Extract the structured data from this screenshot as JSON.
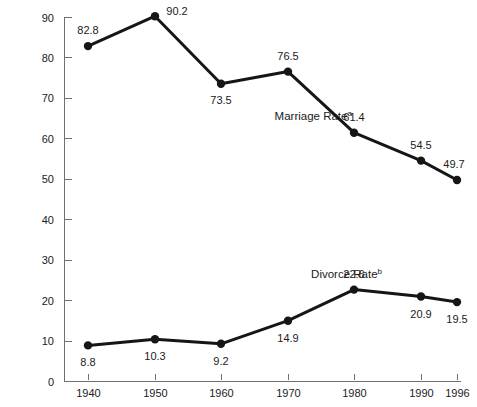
{
  "chart_data": {
    "type": "line",
    "title": "",
    "xlabel": "",
    "ylabel": "",
    "categories": [
      "1940",
      "1950",
      "1960",
      "1970",
      "1980",
      "1990",
      "1996"
    ],
    "x": [
      1940,
      1950,
      1960,
      1970,
      1980,
      1990,
      1996
    ],
    "xlim": [
      1940,
      1996
    ],
    "ylim": [
      0,
      90
    ],
    "y_ticks": [
      "0",
      "10",
      "20",
      "30",
      "40",
      "50",
      "60",
      "70",
      "80",
      "90"
    ],
    "y_tick_values": [
      0,
      10,
      20,
      30,
      40,
      50,
      60,
      70,
      80,
      90
    ],
    "grid": false,
    "legend_position": "inline-annotation",
    "series": [
      {
        "name": "Marriage Rate",
        "footnote": "a",
        "label_x": 1968,
        "label_y": 64.5,
        "values": [
          82.8,
          90.2,
          73.5,
          76.5,
          61.4,
          54.5,
          49.7
        ],
        "value_labels": [
          "82.8",
          "90.2",
          "73.5",
          "76.5",
          "61.4",
          "54.5",
          "49.7"
        ],
        "label_offsets": [
          {
            "dx": 0,
            "dy": -12
          },
          {
            "dx": 22,
            "dy": -1
          },
          {
            "dx": 0,
            "dy": 20
          },
          {
            "dx": 0,
            "dy": -12
          },
          {
            "dx": 0,
            "dy": -12
          },
          {
            "dx": 0,
            "dy": -12
          },
          {
            "dx": -3,
            "dy": -12
          }
        ],
        "color": "#161616"
      },
      {
        "name": "Divorce Rate",
        "footnote": "b",
        "label_x": 1973.5,
        "label_y": 25.5,
        "values": [
          8.8,
          10.3,
          9.2,
          14.9,
          22.6,
          20.9,
          19.5
        ],
        "value_labels": [
          "8.8",
          "10.3",
          "9.2",
          "14.9",
          "22.6",
          "20.9",
          "19.5"
        ],
        "label_offsets": [
          {
            "dx": 0,
            "dy": 21
          },
          {
            "dx": 0,
            "dy": 21
          },
          {
            "dx": 0,
            "dy": 21
          },
          {
            "dx": 0,
            "dy": 21
          },
          {
            "dx": 0,
            "dy": -12
          },
          {
            "dx": 0,
            "dy": 21
          },
          {
            "dx": 0,
            "dy": 21
          }
        ],
        "color": "#161616"
      }
    ],
    "colors": {
      "line": "#161616",
      "axis": "#6f6f6f",
      "text": "#1b1b1b",
      "background": "#ffffff"
    }
  }
}
